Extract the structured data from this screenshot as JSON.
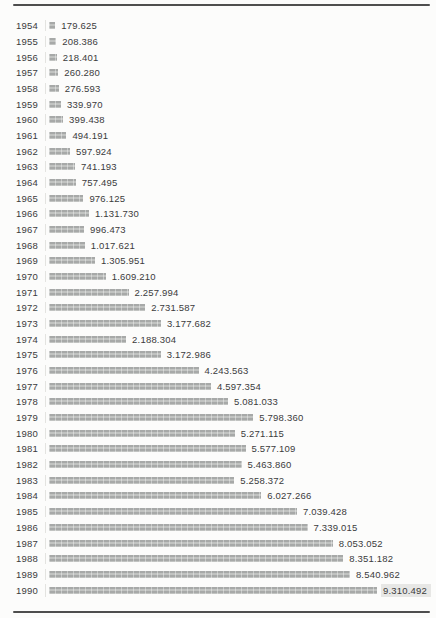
{
  "page": {
    "background_color": "#fcfcfb",
    "rule_color": "#4e4e4e",
    "text_color": "#3b3b3b"
  },
  "chart_data": {
    "type": "bar",
    "orientation": "horizontal",
    "title": "",
    "xlabel": "",
    "ylabel": "",
    "grid": false,
    "legend": false,
    "xlim": [
      0,
      9500000
    ],
    "bar_color": "#b2b4b3",
    "categories": [
      "1954",
      "1955",
      "1956",
      "1957",
      "1958",
      "1959",
      "1960",
      "1961",
      "1962",
      "1963",
      "1964",
      "1965",
      "1966",
      "1967",
      "1968",
      "1969",
      "1970",
      "1971",
      "1972",
      "1973",
      "1974",
      "1975",
      "1976",
      "1977",
      "1978",
      "1979",
      "1980",
      "1981",
      "1982",
      "1983",
      "1984",
      "1985",
      "1986",
      "1987",
      "1988",
      "1989",
      "1990"
    ],
    "values": [
      179625,
      208386,
      218401,
      260280,
      276593,
      339970,
      399438,
      494191,
      597924,
      741193,
      757495,
      976125,
      1131730,
      996473,
      1017621,
      1305951,
      1609210,
      2257994,
      2731587,
      3177682,
      2188304,
      3172986,
      4243563,
      4597354,
      5081033,
      5798360,
      5271115,
      5577109,
      5463860,
      5258372,
      6027266,
      7039428,
      7339015,
      8053052,
      8351182,
      8540962,
      9310492
    ],
    "value_labels": [
      "179.625",
      "208.386",
      "218.401",
      "260.280",
      "276.593",
      "339.970",
      "399.438",
      "494.191",
      "597.924",
      "741.193",
      "757.495",
      "976.125",
      "1.131.730",
      "996.473",
      "1.017.621",
      "1.305.951",
      "1.609.210",
      "2.257.994",
      "2.731.587",
      "3.177.682",
      "2.188.304",
      "3.172.986",
      "4.243.563",
      "4.597.354",
      "5.081.033",
      "5.798.360",
      "5.271.115",
      "5.577.109",
      "5.463.860",
      "5.258.372",
      "6.027.266",
      "7.039.428",
      "7.339.015",
      "8.053.052",
      "8.351.182",
      "8.540.962",
      "9.310.492"
    ],
    "highlight_last_value_label": true
  }
}
